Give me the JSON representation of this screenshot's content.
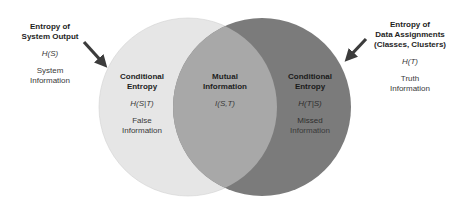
{
  "diagram": {
    "type": "venn",
    "colors": {
      "left_circle": "#e6e6e6",
      "overlap": "#a8a8a8",
      "right_circle": "#7b7b7b",
      "arrow": "#3c3c3c"
    },
    "left_outer": {
      "title_line1": "Entropy of",
      "title_line2": "System Output",
      "math": "H(S)",
      "desc_line1": "System",
      "desc_line2": "Information"
    },
    "right_outer": {
      "title_line1": "Entropy of",
      "title_line2": "Data Assignments",
      "title_line3": "(Classes, Clusters)",
      "math": "H(T)",
      "desc_line1": "Truth",
      "desc_line2": "Information"
    },
    "left_region": {
      "title_line1": "Conditional",
      "title_line2": "Entropy",
      "math": "H(S|T)",
      "desc_line1": "False",
      "desc_line2": "Information"
    },
    "middle_region": {
      "title_line1": "Mutual",
      "title_line2": "Information",
      "math": "I(S,T)"
    },
    "right_region": {
      "title_line1": "Conditional",
      "title_line2": "Entropy",
      "math": "H(T|S)",
      "desc_line1": "Missed",
      "desc_line2": "Information"
    }
  }
}
